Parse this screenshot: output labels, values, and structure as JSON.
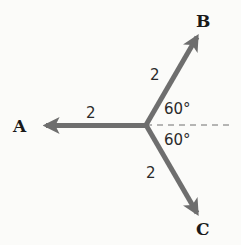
{
  "diagram": {
    "type": "vector-diagram",
    "colors": {
      "vector": "#6e6e6e",
      "dashed": "#6e6e6e",
      "text": "#1a1a1a",
      "background": "#fbfbf9"
    },
    "vectors": [
      {
        "name": "A",
        "label": "A",
        "magnitude_label": "2",
        "direction": "left"
      },
      {
        "name": "B",
        "label": "B",
        "magnitude_label": "2",
        "direction": "up-right"
      },
      {
        "name": "C",
        "label": "C",
        "magnitude_label": "2",
        "direction": "down-right"
      }
    ],
    "angles": [
      {
        "label": "60°",
        "between": "B and horizontal"
      },
      {
        "label": "60°",
        "between": "C and horizontal"
      }
    ]
  }
}
